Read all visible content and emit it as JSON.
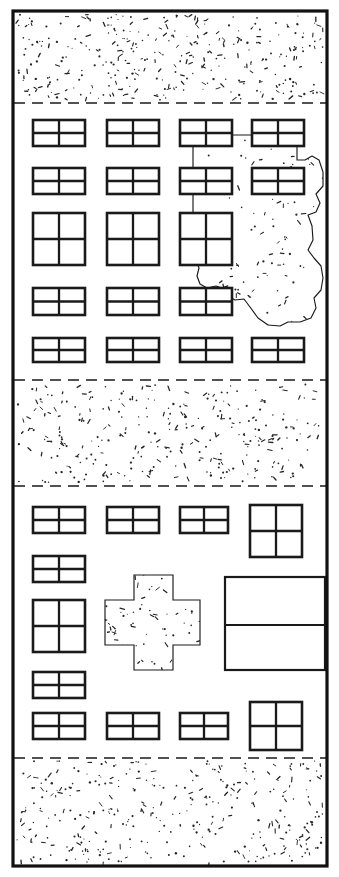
{
  "document": {
    "title": "Urban block site plan",
    "type": "line-drawing",
    "width": 339,
    "height": 877,
    "background_color": "#ffffff",
    "ink_color": "#1a1a1a",
    "stipple_color": "#262626"
  },
  "frame": {
    "name": "site-boundary",
    "x": 13,
    "y": 11,
    "width": 314,
    "height": 855,
    "stroke_width": 3.2,
    "stroke_color": "#111111",
    "fill": "#ffffff"
  },
  "bands": [
    {
      "id": "band-street-top",
      "label": "Stippled open ground (top)",
      "kind": "stipple",
      "y_top": 11,
      "y_bottom": 103,
      "stipple_density": 330,
      "dashed_edges": [
        "bottom"
      ]
    },
    {
      "id": "band-blocks-upper",
      "label": "Upper building block",
      "kind": "buildings",
      "y_top": 103,
      "y_bottom": 380,
      "dashed_edges": []
    },
    {
      "id": "band-street-middle",
      "label": "Stippled open ground (middle)",
      "kind": "stipple",
      "y_top": 380,
      "y_bottom": 486,
      "stipple_density": 300,
      "dashed_edges": [
        "top",
        "bottom"
      ]
    },
    {
      "id": "band-blocks-lower",
      "label": "Lower building block",
      "kind": "buildings",
      "y_top": 486,
      "y_bottom": 758,
      "dashed_edges": []
    },
    {
      "id": "band-street-bottom",
      "label": "Stippled open ground (bottom)",
      "kind": "stipple",
      "y_top": 758,
      "y_bottom": 866,
      "stipple_density": 340,
      "dashed_edges": [
        "top"
      ]
    }
  ],
  "dashed_lines": [
    {
      "id": "dash-1",
      "y": 103,
      "x1": 14,
      "x2": 326,
      "dash": "11 7"
    },
    {
      "id": "dash-2",
      "y": 380,
      "x1": 14,
      "x2": 326,
      "dash": "11 7"
    },
    {
      "id": "dash-3",
      "y": 486,
      "x1": 14,
      "x2": 326,
      "dash": "11 7"
    },
    {
      "id": "dash-4",
      "y": 758,
      "x1": 14,
      "x2": 326,
      "dash": "11 7"
    }
  ],
  "buildings": [
    {
      "id": "u-r1-c1",
      "x": 33,
      "y": 120,
      "w": 52,
      "h": 26,
      "cols": 2,
      "rows": 2,
      "band": "band-blocks-upper"
    },
    {
      "id": "u-r1-c2",
      "x": 107,
      "y": 120,
      "w": 52,
      "h": 26,
      "cols": 2,
      "rows": 2,
      "band": "band-blocks-upper"
    },
    {
      "id": "u-r1-c3",
      "x": 180,
      "y": 120,
      "w": 52,
      "h": 26,
      "cols": 2,
      "rows": 2,
      "band": "band-blocks-upper"
    },
    {
      "id": "u-r1-c4",
      "x": 252,
      "y": 120,
      "w": 52,
      "h": 26,
      "cols": 2,
      "rows": 2,
      "band": "band-blocks-upper"
    },
    {
      "id": "u-r2-c1",
      "x": 33,
      "y": 168,
      "w": 52,
      "h": 26,
      "cols": 2,
      "rows": 2,
      "band": "band-blocks-upper"
    },
    {
      "id": "u-r2-c2",
      "x": 107,
      "y": 168,
      "w": 52,
      "h": 26,
      "cols": 2,
      "rows": 2,
      "band": "band-blocks-upper"
    },
    {
      "id": "u-r2-c3",
      "x": 180,
      "y": 168,
      "w": 52,
      "h": 26,
      "cols": 2,
      "rows": 2,
      "band": "band-blocks-upper"
    },
    {
      "id": "u-r2-c4",
      "x": 252,
      "y": 168,
      "w": 52,
      "h": 26,
      "cols": 2,
      "rows": 2,
      "band": "band-blocks-upper"
    },
    {
      "id": "u-r3-c1",
      "x": 33,
      "y": 213,
      "w": 52,
      "h": 52,
      "cols": 2,
      "rows": 2,
      "band": "band-blocks-upper"
    },
    {
      "id": "u-r3-c2",
      "x": 107,
      "y": 213,
      "w": 52,
      "h": 52,
      "cols": 2,
      "rows": 2,
      "band": "band-blocks-upper"
    },
    {
      "id": "u-r3-c3",
      "x": 180,
      "y": 213,
      "w": 52,
      "h": 52,
      "cols": 2,
      "rows": 2,
      "band": "band-blocks-upper"
    },
    {
      "id": "u-r4-c1",
      "x": 33,
      "y": 288,
      "w": 52,
      "h": 27,
      "cols": 2,
      "rows": 2,
      "band": "band-blocks-upper"
    },
    {
      "id": "u-r4-c2",
      "x": 107,
      "y": 288,
      "w": 52,
      "h": 27,
      "cols": 2,
      "rows": 2,
      "band": "band-blocks-upper"
    },
    {
      "id": "u-r4-c3",
      "x": 180,
      "y": 288,
      "w": 52,
      "h": 27,
      "cols": 2,
      "rows": 2,
      "band": "band-blocks-upper"
    },
    {
      "id": "u-r5-c1",
      "x": 33,
      "y": 338,
      "w": 52,
      "h": 24,
      "cols": 2,
      "rows": 2,
      "band": "band-blocks-upper"
    },
    {
      "id": "u-r5-c2",
      "x": 107,
      "y": 338,
      "w": 52,
      "h": 24,
      "cols": 2,
      "rows": 2,
      "band": "band-blocks-upper"
    },
    {
      "id": "u-r5-c3",
      "x": 180,
      "y": 338,
      "w": 52,
      "h": 24,
      "cols": 2,
      "rows": 2,
      "band": "band-blocks-upper"
    },
    {
      "id": "u-r5-c4",
      "x": 252,
      "y": 338,
      "w": 52,
      "h": 24,
      "cols": 2,
      "rows": 2,
      "band": "band-blocks-upper"
    },
    {
      "id": "l-r1-c1",
      "x": 33,
      "y": 507,
      "w": 52,
      "h": 26,
      "cols": 2,
      "rows": 2,
      "band": "band-blocks-lower"
    },
    {
      "id": "l-r1-c2",
      "x": 107,
      "y": 507,
      "w": 52,
      "h": 26,
      "cols": 2,
      "rows": 2,
      "band": "band-blocks-lower"
    },
    {
      "id": "l-r1-c3",
      "x": 180,
      "y": 507,
      "w": 48,
      "h": 26,
      "cols": 2,
      "rows": 2,
      "band": "band-blocks-lower"
    },
    {
      "id": "l-r1-c4",
      "x": 250,
      "y": 505,
      "w": 52,
      "h": 52,
      "cols": 2,
      "rows": 2,
      "band": "band-blocks-lower"
    },
    {
      "id": "l-r2-c1",
      "x": 33,
      "y": 556,
      "w": 52,
      "h": 26,
      "cols": 2,
      "rows": 2,
      "band": "band-blocks-lower"
    },
    {
      "id": "l-r3-c1",
      "x": 33,
      "y": 600,
      "w": 52,
      "h": 52,
      "cols": 2,
      "rows": 2,
      "band": "band-blocks-lower"
    },
    {
      "id": "l-r4-c1",
      "x": 33,
      "y": 672,
      "w": 52,
      "h": 26,
      "cols": 2,
      "rows": 2,
      "band": "band-blocks-lower"
    },
    {
      "id": "l-r5-c1",
      "x": 33,
      "y": 713,
      "w": 52,
      "h": 26,
      "cols": 2,
      "rows": 2,
      "band": "band-blocks-lower"
    },
    {
      "id": "l-r5-c2",
      "x": 107,
      "y": 713,
      "w": 52,
      "h": 26,
      "cols": 2,
      "rows": 2,
      "band": "band-blocks-lower"
    },
    {
      "id": "l-r5-c3",
      "x": 180,
      "y": 713,
      "w": 48,
      "h": 26,
      "cols": 2,
      "rows": 2,
      "band": "band-blocks-lower"
    },
    {
      "id": "l-r5-c4",
      "x": 250,
      "y": 702,
      "w": 52,
      "h": 48,
      "cols": 2,
      "rows": 2,
      "band": "band-blocks-lower"
    }
  ],
  "large_rectangle": {
    "id": "l-big-block",
    "label": "Large two-part building",
    "x": 225,
    "y": 577,
    "w": 100,
    "h": 93,
    "divider_y": 625
  },
  "stipple_blob": {
    "id": "blob-upper",
    "label": "Irregular stippled parcel (upper block)",
    "path": "M 193 135 L 255 135 L 255 137 L 297 137 L 297 160 L 305 160 L 312 156 L 319 160 L 323 172 L 323 186 L 316 194 L 320 203 L 316 212 L 308 215 L 312 226 L 313 240 L 308 250 L 314 258 L 321 266 L 323 278 L 321 290 L 314 298 L 316 308 L 311 318 L 300 322 L 288 322 L 280 326 L 268 325 L 258 318 L 250 307 L 244 299 L 235 300 L 228 296 L 222 288 L 216 286 L 207 288 L 200 284 L 197 276 L 199 268 L 195 258 L 193 248 Z",
    "stipple_density": 150
  },
  "stipple_cross": {
    "id": "cross-lower",
    "label": "Cross-shaped stippled parcel (lower block)",
    "path": "M 134 575 L 173 575 L 173 600 L 200 600 L 200 645 L 173 645 L 173 670 L 134 670 L 134 645 L 105 645 L 105 600 L 134 600 Z",
    "stipple_density": 95
  },
  "legend": {
    "stipple_meaning": "open / unbuilt ground",
    "outline_meaning": "built structures",
    "dashed_meaning": "zone boundary"
  }
}
